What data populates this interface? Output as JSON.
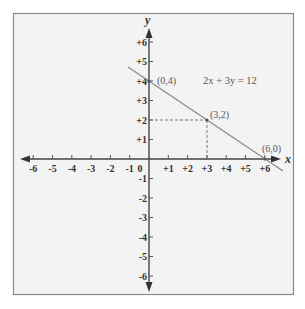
{
  "chart_data": {
    "type": "line",
    "title": "",
    "equation": "2x + 3y = 12",
    "xlabel": "x",
    "ylabel": "y",
    "xlim": [
      -6,
      6
    ],
    "ylim": [
      -6,
      6
    ],
    "grid": false,
    "x_ticks": [
      "-6",
      "-5",
      "-4",
      "-3",
      "-2",
      "-1",
      "0",
      "+1",
      "+2",
      "+3",
      "+4",
      "+5",
      "+6"
    ],
    "y_ticks": [
      "+6",
      "+5",
      "+4",
      "+3",
      "+2",
      "+1",
      "-1",
      "-2",
      "-3",
      "-4",
      "-5",
      "-6"
    ],
    "series": [
      {
        "name": "2x + 3y = 12",
        "x": [
          -1.1,
          6.9
        ],
        "y": [
          4.73,
          -0.6
        ]
      }
    ],
    "points": [
      {
        "label": "(0,4)",
        "x": 0,
        "y": 4
      },
      {
        "label": "(3,2)",
        "x": 3,
        "y": 2
      },
      {
        "label": "(6,0)",
        "x": 6,
        "y": 0
      }
    ],
    "guides": [
      {
        "from": [
          0,
          2
        ],
        "to": [
          3,
          2
        ],
        "style": "dashed"
      },
      {
        "from": [
          3,
          2
        ],
        "to": [
          3,
          0
        ],
        "style": "dashed"
      }
    ]
  },
  "labels": {
    "x_axis": "x",
    "y_axis": "y",
    "equation": "2x + 3y = 12",
    "p1": "(0,4)",
    "p2": "(3,2)",
    "p3": "(6,0)"
  }
}
